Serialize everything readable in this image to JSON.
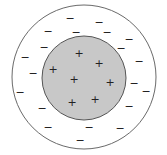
{
  "diagram": {
    "colors": {
      "background": "#ffffff",
      "outer_stroke": "#6a6a6a",
      "inner_fill": "#c8c8c8",
      "inner_stroke": "#555555",
      "sign_color": "#222222"
    },
    "outer_circle": {
      "cx": 84,
      "cy": 77,
      "r": 72
    },
    "inner_circle": {
      "cx": 84,
      "cy": 78,
      "r": 42
    },
    "plus_symbol": "+",
    "minus_symbol": "−",
    "plus_signs": [
      [
        79,
        53
      ],
      [
        99,
        63
      ],
      [
        53,
        69
      ],
      [
        74,
        79
      ],
      [
        110,
        82
      ],
      [
        72,
        102
      ],
      [
        95,
        99
      ]
    ],
    "minus_signs": [
      [
        70,
        18
      ],
      [
        99,
        22
      ],
      [
        48,
        31
      ],
      [
        76,
        32
      ],
      [
        107,
        32
      ],
      [
        129,
        39
      ],
      [
        44,
        47
      ],
      [
        121,
        48
      ],
      [
        25,
        57
      ],
      [
        139,
        61
      ],
      [
        33,
        73
      ],
      [
        134,
        83
      ],
      [
        20,
        92
      ],
      [
        146,
        91
      ],
      [
        42,
        108
      ],
      [
        129,
        106
      ],
      [
        48,
        127
      ],
      [
        89,
        127
      ],
      [
        120,
        128
      ],
      [
        80,
        140
      ]
    ]
  }
}
